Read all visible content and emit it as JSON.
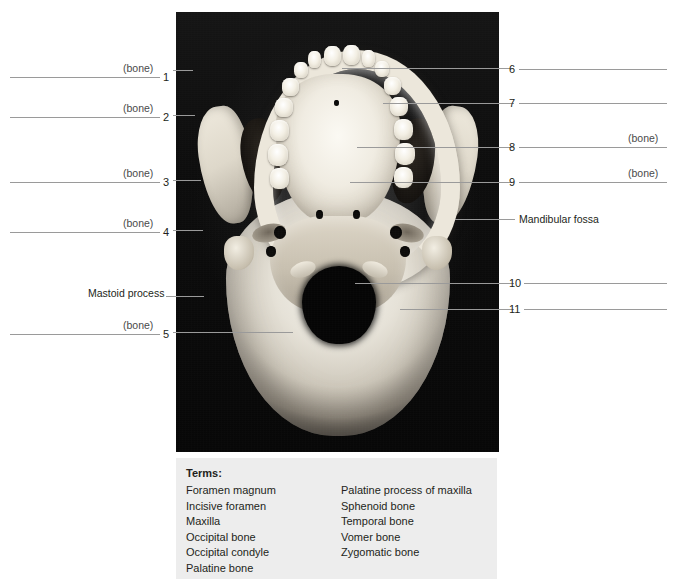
{
  "figure": {
    "image_alt": "Inferior view of human skull photograph",
    "left_labels": [
      {
        "number": "1",
        "suffix": "(bone)",
        "line_x": 10,
        "line_w": 150,
        "y": 77
      },
      {
        "number": "2",
        "suffix": "(bone)",
        "line_x": 10,
        "line_w": 150,
        "y": 117
      },
      {
        "number": "3",
        "suffix": "(bone)",
        "line_x": 10,
        "line_w": 150,
        "y": 182
      },
      {
        "number": "4",
        "suffix": "(bone)",
        "line_x": 10,
        "line_w": 150,
        "y": 232
      },
      {
        "number": "",
        "suffix": "",
        "name": "Mastoid process",
        "y": 293
      },
      {
        "number": "5",
        "suffix": "(bone)",
        "line_x": 10,
        "line_w": 150,
        "y": 334
      }
    ],
    "right_labels": [
      {
        "number": "6",
        "suffix": "",
        "y": 69
      },
      {
        "number": "7",
        "suffix": "",
        "y": 103
      },
      {
        "number": "8",
        "suffix": "(bone)",
        "y": 147
      },
      {
        "number": "9",
        "suffix": "(bone)",
        "y": 182
      },
      {
        "number": "",
        "suffix": "",
        "name": "Mandibular fossa",
        "y": 219
      },
      {
        "number": "10",
        "suffix": "",
        "y": 283
      },
      {
        "number": "11",
        "suffix": "",
        "y": 309
      }
    ]
  },
  "terms": {
    "title": "Terms:",
    "column_1": [
      "Foramen magnum",
      "Incisive foramen",
      "Maxilla",
      "Occipital bone",
      "Occipital condyle",
      "Palatine bone"
    ],
    "column_2": [
      "Palatine process of maxilla",
      "Sphenoid bone",
      "Temporal bone",
      "Vomer bone",
      "Zygomatic bone"
    ]
  },
  "colors": {
    "page_background": "#ffffff",
    "terms_background": "#ededed",
    "leader_line": "#9a9a9a",
    "text": "#231f20",
    "photo_background": "#0a0a0a"
  }
}
